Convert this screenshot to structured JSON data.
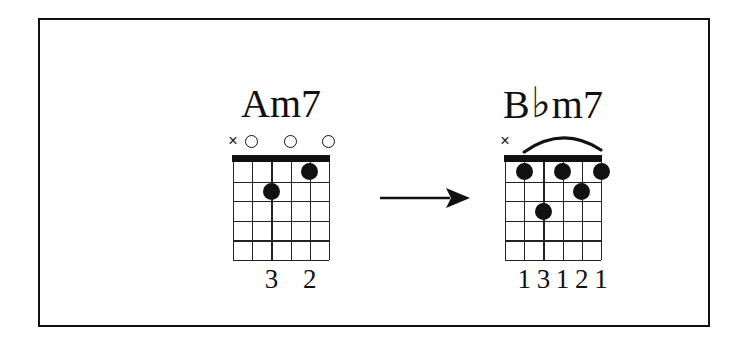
{
  "figure": {
    "type": "guitar-chord-progression",
    "border_color": "#111111",
    "background": "#ffffff",
    "ink_color": "#111111",
    "arrow": {
      "icon": "right-arrow-icon",
      "direction": "right"
    }
  },
  "chords": [
    {
      "id": "am7",
      "name": "Am7",
      "name_root": "A",
      "name_accidental": "",
      "name_quality": "m7",
      "strings": 6,
      "frets": 5,
      "has_nut": true,
      "barre": null,
      "markers": [
        {
          "string": 6,
          "symbol": "×",
          "type": "mute",
          "name": "mute-marker-string-6"
        },
        {
          "string": 5,
          "symbol": "○",
          "type": "open",
          "name": "open-marker-string-5"
        },
        {
          "string": 3,
          "symbol": "○",
          "type": "open",
          "name": "open-marker-string-3"
        },
        {
          "string": 1,
          "symbol": "○",
          "type": "open",
          "name": "open-marker-string-1"
        }
      ],
      "dots": [
        {
          "string": 2,
          "fret": 1
        },
        {
          "string": 4,
          "fret": 2
        }
      ],
      "fingers": [
        {
          "string": 4,
          "label": "3"
        },
        {
          "string": 2,
          "label": "2"
        }
      ]
    },
    {
      "id": "bbm7",
      "name": "B♭m7",
      "name_root": "B",
      "name_accidental": "♭",
      "name_quality": "m7",
      "strings": 6,
      "frets": 5,
      "has_nut": true,
      "barre": {
        "fret": 1,
        "from_string": 5,
        "to_string": 1
      },
      "markers": [
        {
          "string": 6,
          "symbol": "×",
          "type": "mute",
          "name": "mute-marker-string-6"
        }
      ],
      "dots": [
        {
          "string": 5,
          "fret": 1
        },
        {
          "string": 3,
          "fret": 1
        },
        {
          "string": 1,
          "fret": 1
        },
        {
          "string": 2,
          "fret": 2
        },
        {
          "string": 4,
          "fret": 3
        }
      ],
      "fingers": [
        {
          "string": 5,
          "label": "1"
        },
        {
          "string": 4,
          "label": "3"
        },
        {
          "string": 3,
          "label": "1"
        },
        {
          "string": 2,
          "label": "2"
        },
        {
          "string": 1,
          "label": "1"
        }
      ]
    }
  ]
}
